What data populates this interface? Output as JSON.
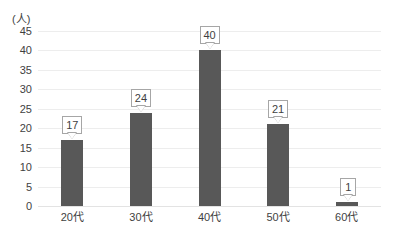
{
  "chart_data": {
    "type": "bar",
    "title": "",
    "xlabel": "",
    "ylabel": "(人)",
    "categories": [
      "20代",
      "30代",
      "40代",
      "50代",
      "60代"
    ],
    "values": [
      17,
      24,
      40,
      21,
      1
    ],
    "value_labels": [
      "17",
      "24",
      "40",
      "21",
      "1"
    ],
    "ylim": [
      0,
      45
    ],
    "ytick_labels": [
      "45",
      "40",
      "35",
      "30",
      "25",
      "20",
      "15",
      "10",
      "5",
      "0"
    ],
    "ytick_values": [
      45,
      40,
      35,
      30,
      25,
      20,
      15,
      10,
      5,
      0
    ],
    "ytick_step": 5,
    "grid": true,
    "legend": false,
    "legend_position": "none",
    "series": [
      {
        "name": "人数",
        "values": [
          17,
          24,
          40,
          21,
          1
        ],
        "color": "#585858"
      }
    ],
    "bar_color": "#585858",
    "gridline_color": "#ededed",
    "label_box_border_color": "#a6a6a6",
    "label_box_fill_color": "#ffffff",
    "text_color": "#3f3f3f"
  },
  "axis_unit_label": "(人)"
}
